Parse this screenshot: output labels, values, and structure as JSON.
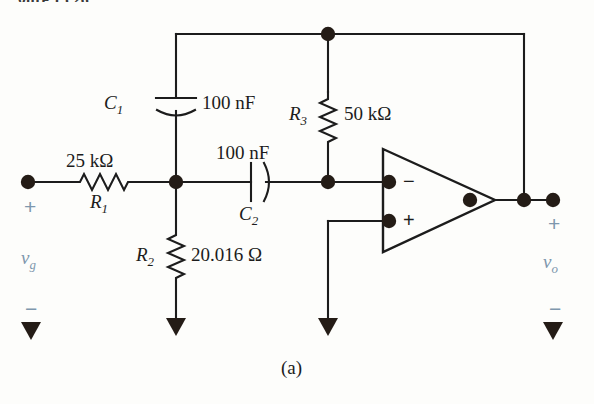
{
  "figure": {
    "caption": "(a)",
    "top_partial_text": "gure 15.26"
  },
  "components": {
    "r1": {
      "ref": "R",
      "sub": "1",
      "value": "25 kΩ"
    },
    "r2": {
      "ref": "R",
      "sub": "2",
      "value": "20.016 Ω"
    },
    "r3": {
      "ref": "R",
      "sub": "3",
      "value": "50 kΩ"
    },
    "c1": {
      "ref": "C",
      "sub": "1",
      "value": "100 nF"
    },
    "c2": {
      "ref": "C",
      "sub": "2",
      "value": "100 nF"
    }
  },
  "sources": {
    "input": {
      "symbol": "v",
      "sub": "g",
      "plus": "+",
      "minus": "−"
    },
    "output": {
      "symbol": "v",
      "sub": "o",
      "plus": "+",
      "minus": "−"
    }
  },
  "opamp": {
    "inverting_sign": "−",
    "noninverting_sign": "+"
  },
  "colors": {
    "wire": "#1c1c1c",
    "node": "#241c16",
    "source_label": "#7e97ad",
    "background": "#fdfdfb"
  }
}
